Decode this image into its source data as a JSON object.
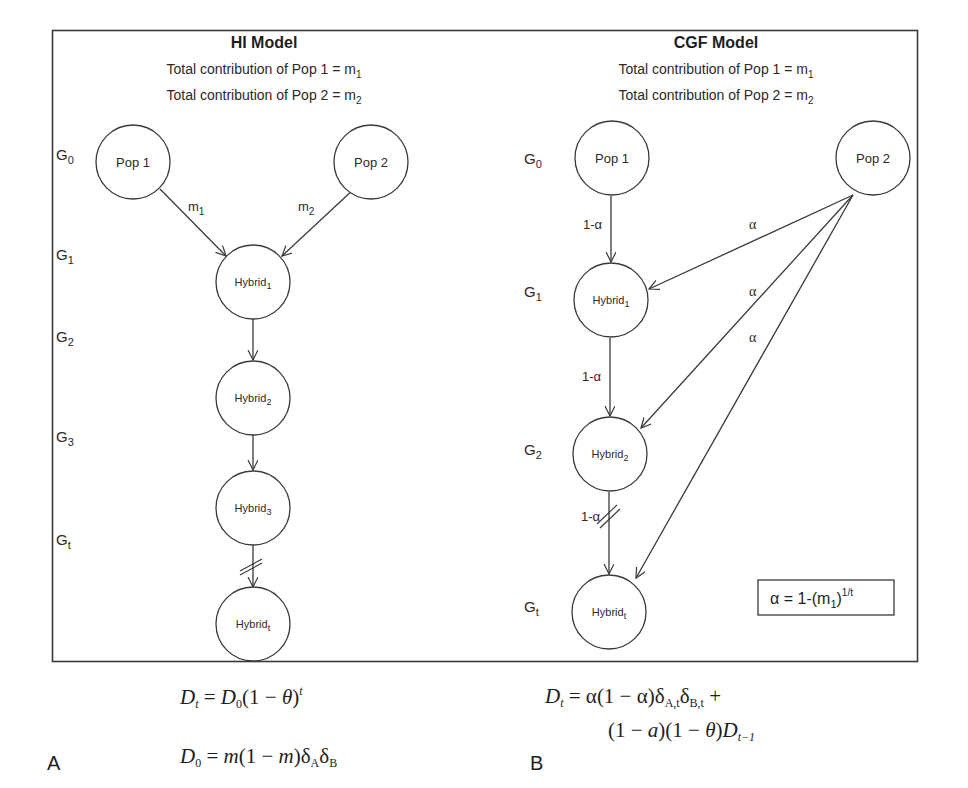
{
  "panels": {
    "hi": {
      "title": "HI Model",
      "contrib_1_text": "Total contribution of Pop 1 = m",
      "contrib_1_sub": "1",
      "contrib_2_text": "Total contribution of Pop 2 = m",
      "contrib_2_sub": "2",
      "generations": [
        {
          "base": "G",
          "sub": "0"
        },
        {
          "base": "G",
          "sub": "1"
        },
        {
          "base": "G",
          "sub": "2"
        },
        {
          "base": "G",
          "sub": "3"
        },
        {
          "base": "G",
          "sub": "t"
        }
      ],
      "nodes": [
        {
          "id": "pop1",
          "base": "Pop 1",
          "sub": ""
        },
        {
          "id": "pop2",
          "base": "Pop 2",
          "sub": ""
        },
        {
          "id": "hybrid1",
          "base": "Hybrid",
          "sub": "1"
        },
        {
          "id": "hybrid2",
          "base": "Hybrid",
          "sub": "2"
        },
        {
          "id": "hybrid3",
          "base": "Hybrid",
          "sub": "3"
        },
        {
          "id": "hybridt",
          "base": "Hybrid",
          "sub": "t"
        }
      ],
      "edges": [
        {
          "from": "pop1",
          "to": "hybrid1",
          "label_base": "m",
          "label_sub": "1"
        },
        {
          "from": "pop2",
          "to": "hybrid1",
          "label_base": "m",
          "label_sub": "2"
        },
        {
          "from": "hybrid1",
          "to": "hybrid2"
        },
        {
          "from": "hybrid2",
          "to": "hybrid3"
        },
        {
          "from": "hybrid3",
          "to": "hybridt",
          "break": true
        }
      ],
      "letter": "A",
      "equations": {
        "line1": {
          "lhs": "D",
          "lhs_sub": "t",
          "eq": " = ",
          "rhs_a": "D",
          "rhs_a_sub": "0",
          "rhs_b": "(1 − ",
          "theta": "θ",
          "rhs_c": ")",
          "rhs_sup": "t"
        },
        "line2": {
          "lhs": "D",
          "lhs_sub": "0",
          "eq": " = ",
          "m1": "m",
          "mid": "(1 − ",
          "m2": "m",
          "close": ")",
          "d1": "δ",
          "d1_sub": "A",
          "d2": "δ",
          "d2_sub": "B"
        }
      }
    },
    "cgf": {
      "title": "CGF Model",
      "contrib_1_text": "Total contribution of Pop 1 = m",
      "contrib_1_sub": "1",
      "contrib_2_text": "Total contribution of Pop 2 = m",
      "contrib_2_sub": "2",
      "generations": [
        {
          "base": "G",
          "sub": "0"
        },
        {
          "base": "G",
          "sub": "1"
        },
        {
          "base": "G",
          "sub": "2"
        },
        {
          "base": "G",
          "sub": "t"
        }
      ],
      "nodes": [
        {
          "id": "pop1",
          "base": "Pop 1",
          "sub": ""
        },
        {
          "id": "pop2",
          "base": "Pop 2",
          "sub": ""
        },
        {
          "id": "hybrid1",
          "base": "Hybrid",
          "sub": "1"
        },
        {
          "id": "hybrid2",
          "base": "Hybrid",
          "sub": "2"
        },
        {
          "id": "hybridt",
          "base": "Hybrid",
          "sub": "t"
        }
      ],
      "edges": [
        {
          "from": "pop1",
          "to": "hybrid1",
          "label": "1-α"
        },
        {
          "from": "hybrid1",
          "to": "hybrid2",
          "label": "1-α"
        },
        {
          "from": "hybrid2",
          "to": "hybridt",
          "label": "1-α",
          "break": true
        },
        {
          "from": "pop2",
          "to": "hybrid1",
          "label": "α"
        },
        {
          "from": "pop2",
          "to": "hybrid2",
          "label": "α"
        },
        {
          "from": "pop2",
          "to": "hybridt",
          "label": "α"
        }
      ],
      "formula": {
        "lhs": "α = 1-(m",
        "sub": "1",
        "close": ")",
        "sup": "1/t"
      },
      "letter": "B",
      "equations": {
        "line1": {
          "lhs": "D",
          "lhs_sub": "t",
          "eq": " = ",
          "a1": "α",
          "mid": "(1 − ",
          "a2": "α",
          "close": ")",
          "d1": "δ",
          "d1_sub": "A,t",
          "d2": "δ",
          "d2_sub": "B,t",
          "plus": " +"
        },
        "line2": {
          "open1": "(1 − ",
          "a": "a",
          "close1": ")(1 − ",
          "theta": "θ",
          "close2": ")",
          "D": "D",
          "D_sub": "t−1"
        }
      }
    }
  },
  "colors": {
    "stroke": "#3a3a3a",
    "text": "#222222",
    "background": "#ffffff"
  }
}
